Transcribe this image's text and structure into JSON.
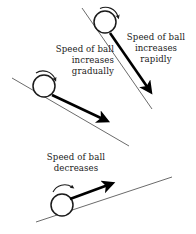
{
  "figure": {
    "background_color": "#ffffff",
    "ramp_color": "#6b6b6b",
    "ball_color": "#1a1a1a",
    "arrow_color": "#000000",
    "text_color": "#1a1a1a"
  },
  "panels": [
    {
      "id": "steep-decline",
      "caption_lines": [
        "Speed of ball",
        "increases",
        "rapidly"
      ],
      "incline": "steep downhill",
      "ball_spin": "clockwise",
      "velocity_direction": "down-slope"
    },
    {
      "id": "gentle-decline",
      "caption_lines": [
        "Speed of ball",
        "increases",
        "gradually"
      ],
      "incline": "gentle downhill",
      "ball_spin": "clockwise",
      "velocity_direction": "down-slope"
    },
    {
      "id": "incline-uphill",
      "caption_lines": [
        "Speed of ball",
        "decreases"
      ],
      "incline": "uphill",
      "ball_spin": "clockwise",
      "velocity_direction": "up-slope"
    }
  ]
}
